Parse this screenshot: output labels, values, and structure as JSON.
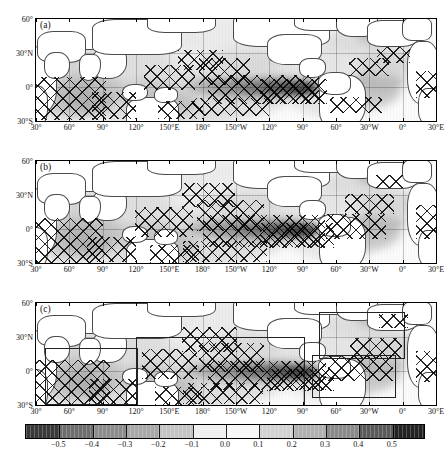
{
  "figure": {
    "type": "map-panels-with-colorbar",
    "panel_count": 3
  },
  "panels": [
    {
      "label": "(a)"
    },
    {
      "label": "(b)"
    },
    {
      "label": "(c)"
    }
  ],
  "axes": {
    "x_ticks": [
      "30°",
      "60°",
      "90°",
      "120°",
      "150°E",
      "180°",
      "150°W",
      "120°",
      "90°",
      "60°",
      "30°W",
      "0°",
      "30°E"
    ],
    "y_ticks": [
      "60°",
      "30°N",
      "0°",
      "30°S"
    ],
    "x_range_label": "30°E to 30°E",
    "y_range_label": "30°S to 60°N"
  },
  "colorbar": {
    "ticks": [
      "−0.5",
      "−0.4",
      "−0.3",
      "−0.2",
      "−0.1",
      "0.0",
      "0.1",
      "0.2",
      "0.3",
      "0.4",
      "0.5"
    ],
    "min": -0.6,
    "max": 0.6,
    "step": 0.1,
    "orientation": "horizontal",
    "colors": [
      "#3a3a3a",
      "#6e6e6e",
      "#8c8c8c",
      "#a8a8a8",
      "#c4c4c4",
      "#efefef",
      "#f7f7f7",
      "#d2d2d2",
      "#b0b0b0",
      "#8a8a8a",
      "#5a5a5a",
      "#232323"
    ]
  },
  "chart_data": {
    "type": "heatmap",
    "title": "",
    "xlabel": "",
    "ylabel": "",
    "subplots": [
      {
        "label": "(a)",
        "x_ticks": [
          "30°",
          "60°",
          "90°",
          "120°",
          "150°E",
          "180°",
          "150°W",
          "120°",
          "90°",
          "60°",
          "30°W",
          "0°",
          "30°E"
        ],
        "y_ticks": [
          "60°",
          "30°N",
          "0°",
          "30°S"
        ],
        "xlim": [
          30,
          390
        ],
        "ylim": [
          -30,
          60
        ],
        "grid": true,
        "significance_hatching": true,
        "notes": "Positive correlation maximum along equatorial central-eastern Pacific, values reaching 0.5+; broad positive signal across tropical Indian Ocean and tropical Atlantic; weak negative lobes in North Pacific mid-latitudes."
      },
      {
        "label": "(b)",
        "x_ticks": [
          "30°",
          "60°",
          "90°",
          "120°",
          "150°E",
          "180°",
          "150°W",
          "120°",
          "90°",
          "60°",
          "30°W",
          "0°",
          "30°E"
        ],
        "y_ticks": [
          "60°",
          "30°N",
          "0°",
          "30°S"
        ],
        "xlim": [
          30,
          390
        ],
        "ylim": [
          -30,
          60
        ],
        "grid": true,
        "significance_hatching": true,
        "notes": "Similar equatorial Pacific positive band, with more extensive hatched significance across the Indian Ocean and subtropical North Pacific."
      },
      {
        "label": "(c)",
        "x_ticks": [
          "30°",
          "60°",
          "90°",
          "120°",
          "150°E",
          "180°",
          "150°W",
          "120°",
          "90°",
          "60°",
          "30°W",
          "0°",
          "30°E"
        ],
        "y_ticks": [
          "60°",
          "30°N",
          "0°",
          "30°S"
        ],
        "xlim": [
          30,
          390
        ],
        "ylim": [
          -30,
          60
        ],
        "grid": true,
        "significance_hatching": true,
        "region_boxes": 4,
        "notes": "Same field with four rectangular region boxes outlining tropical Indian Ocean, tropical Pacific, North Atlantic and tropical Atlantic analysis domains."
      }
    ],
    "colorbar": {
      "ticks": [
        -0.5,
        -0.4,
        -0.3,
        -0.2,
        -0.1,
        0.0,
        0.1,
        0.2,
        0.3,
        0.4,
        0.5
      ],
      "vmin": -0.6,
      "vmax": 0.6,
      "cmap": "grayscale-diverging"
    }
  }
}
